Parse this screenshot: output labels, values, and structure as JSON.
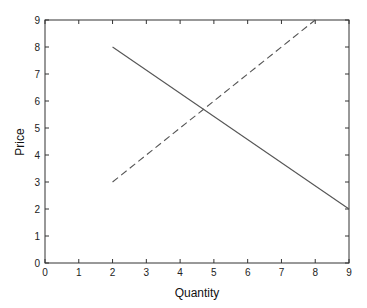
{
  "chart_data": {
    "type": "line",
    "title": "",
    "xlabel": "Quantity",
    "ylabel": "Price",
    "xlim": [
      0,
      9
    ],
    "ylim": [
      0,
      9
    ],
    "xticks": [
      0,
      1,
      2,
      3,
      4,
      5,
      6,
      7,
      8,
      9
    ],
    "yticks": [
      0,
      1,
      2,
      3,
      4,
      5,
      6,
      7,
      8,
      9
    ],
    "grid": false,
    "legend": null,
    "series": [
      {
        "name": "demand",
        "style": "solid",
        "color": "#555555",
        "x": [
          2,
          9
        ],
        "y": [
          8,
          2
        ]
      },
      {
        "name": "supply",
        "style": "dashed",
        "color": "#555555",
        "x": [
          2,
          8
        ],
        "y": [
          3,
          9
        ]
      }
    ]
  }
}
